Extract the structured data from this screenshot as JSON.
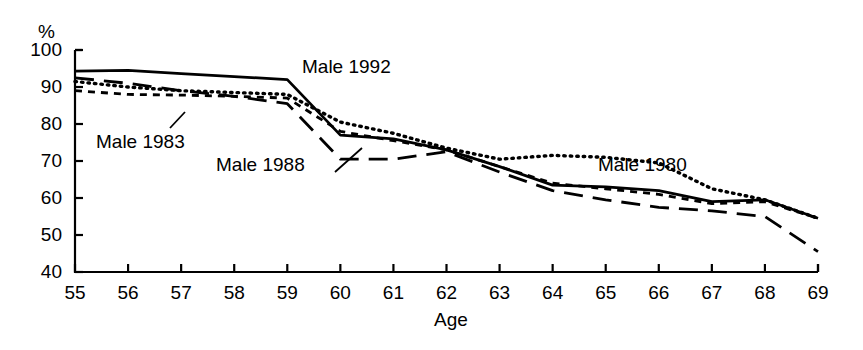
{
  "chart_data": {
    "type": "line",
    "title": "",
    "subtitle": "",
    "xlabel": "Age",
    "ylabel": "%",
    "unit_label": "%",
    "xlim": [
      55,
      69
    ],
    "ylim": [
      40,
      100
    ],
    "xticks": [
      "55",
      "56",
      "57",
      "58",
      "59",
      "60",
      "61",
      "62",
      "63",
      "64",
      "65",
      "66",
      "67",
      "68",
      "69"
    ],
    "yticks": [
      "40",
      "50",
      "60",
      "70",
      "80",
      "90",
      "100"
    ],
    "grid": false,
    "legend_position": "inline-annotations",
    "x": [
      55,
      56,
      57,
      58,
      59,
      60,
      61,
      62,
      63,
      64,
      65,
      66,
      67,
      68,
      69
    ],
    "series": [
      {
        "name": "Male 1992",
        "style": "solid",
        "color": "#000000",
        "values": [
          94.3,
          94.5,
          93.6,
          92.8,
          92.0,
          77.0,
          76.0,
          73.0,
          68.5,
          63.5,
          63.0,
          62.0,
          59.0,
          59.5,
          54.5
        ]
      },
      {
        "name": "Male 1980",
        "style": "dotted",
        "color": "#000000",
        "values": [
          91.5,
          90.0,
          89.0,
          88.5,
          88.0,
          80.5,
          77.5,
          73.5,
          70.5,
          71.5,
          71.0,
          69.5,
          62.5,
          59.5,
          54.5
        ]
      },
      {
        "name": "Male 1983",
        "style": "dashed-short",
        "color": "#000000",
        "values": [
          89.0,
          88.0,
          87.8,
          87.5,
          87.0,
          78.0,
          75.5,
          73.0,
          68.5,
          64.0,
          62.5,
          61.0,
          58.5,
          59.0,
          54.5
        ]
      },
      {
        "name": "Male 1988",
        "style": "dashed-long",
        "color": "#000000",
        "values": [
          92.5,
          91.0,
          89.0,
          87.5,
          85.5,
          70.5,
          70.5,
          72.5,
          67.0,
          62.0,
          59.5,
          57.5,
          56.5,
          55.0,
          45.5
        ]
      }
    ],
    "annotations": [
      {
        "name": "Male 1992",
        "text": "Male 1992",
        "x_px": 302,
        "y_px": 57,
        "leader": false
      },
      {
        "name": "Male 1983",
        "text": "Male 1983",
        "x_px": 96,
        "y_px": 132,
        "leader": true,
        "leader_from": [
          170,
          128
        ],
        "leader_to": [
          185,
          112
        ]
      },
      {
        "name": "Male 1988",
        "text": "Male 1988",
        "x_px": 216,
        "y_px": 155,
        "leader": true,
        "leader_from": [
          335,
          172
        ],
        "leader_to": [
          362,
          148
        ]
      },
      {
        "name": "Male 1980",
        "text": "Male 1980",
        "x_px": 598,
        "y_px": 155,
        "leader": false
      }
    ]
  },
  "axes": {
    "x_title": "Age",
    "y_unit": "%"
  }
}
